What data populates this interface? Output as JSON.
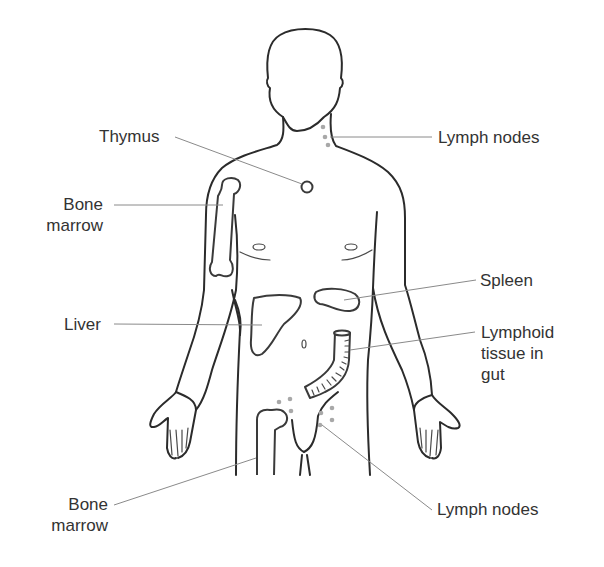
{
  "diagram": {
    "colors": {
      "outline": "#2b2b2b",
      "leader_line": "#8a8a8a",
      "lymph_node_dot": "#a8a8a8",
      "label_text": "#333333",
      "background": "#ffffff"
    },
    "labels": {
      "thymus": "Thymus",
      "lymph_nodes_neck": "Lymph nodes",
      "bone_marrow_arm_line1": "Bone",
      "bone_marrow_arm_line2": "marrow",
      "spleen": "Spleen",
      "liver": "Liver",
      "lymphoid_gut_line1": "Lymphoid",
      "lymphoid_gut_line2": "tissue in",
      "lymphoid_gut_line3": "gut",
      "bone_marrow_leg_line1": "Bone",
      "bone_marrow_leg_line2": "marrow",
      "lymph_nodes_groin": "Lymph nodes"
    }
  }
}
